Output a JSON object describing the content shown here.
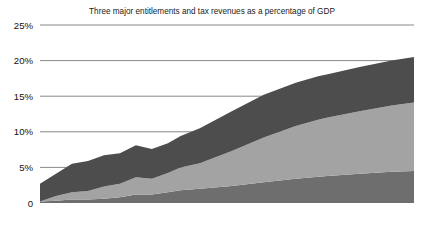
{
  "chart_data": {
    "type": "area",
    "title": "Three major entitlements and tax revenues as a percentage of GDP",
    "xlabel": "",
    "ylabel": "",
    "xlim": [
      1965,
      2082
    ],
    "ylim": [
      0,
      25
    ],
    "grid": true,
    "legend_position": "inline-labels",
    "stacked": true,
    "ytick_labels": [
      "0",
      "5%",
      "10%",
      "15%",
      "20%",
      "25%"
    ],
    "ytick_values": [
      0,
      5,
      10,
      15,
      20,
      25
    ],
    "xtick_labels": [
      "1965",
      "1975",
      "1985",
      "1995",
      "2005",
      "2015",
      "2025",
      "2035",
      "2045",
      "2055",
      "2065",
      "2075",
      "2082"
    ],
    "xtick_values": [
      1965,
      1975,
      1985,
      1995,
      2005,
      2015,
      2025,
      2035,
      2045,
      2055,
      2065,
      2075,
      2082
    ],
    "x": [
      1965,
      1970,
      1975,
      1980,
      1985,
      1990,
      1995,
      2000,
      2005,
      2009,
      2015,
      2025,
      2035,
      2045,
      2052,
      2055,
      2065,
      2075,
      2082
    ],
    "series": [
      {
        "name": "Medicaid",
        "color": "#6e6e6e",
        "values": [
          0.2,
          0.3,
          0.5,
          0.5,
          0.6,
          0.8,
          1.2,
          1.2,
          1.5,
          1.8,
          2.0,
          2.4,
          2.9,
          3.4,
          3.7,
          3.8,
          4.1,
          4.4,
          4.5
        ]
      },
      {
        "name": "Medicare",
        "color": "#a3a3a3",
        "values": [
          0.0,
          0.7,
          1.0,
          1.2,
          1.7,
          1.9,
          2.4,
          2.2,
          2.7,
          3.2,
          3.6,
          4.9,
          6.3,
          7.4,
          8.0,
          8.2,
          8.8,
          9.3,
          9.6
        ]
      },
      {
        "name": "Social Security",
        "color": "#4d4d4d",
        "values": [
          2.5,
          3.1,
          4.0,
          4.2,
          4.4,
          4.3,
          4.5,
          4.2,
          4.2,
          4.4,
          4.9,
          5.6,
          6.0,
          6.1,
          6.1,
          6.1,
          6.2,
          6.3,
          6.4
        ]
      }
    ],
    "tax_revenue_line": {
      "name": "Actual tax revenue",
      "color": "#000000",
      "x": [
        1965,
        1967,
        1969,
        1971,
        1973,
        1975,
        1977,
        1979,
        1981,
        1983,
        1985,
        1987,
        1989,
        1991,
        1993,
        1995,
        1997,
        1999,
        2000,
        2001,
        2003,
        2004,
        2006,
        2008,
        2009
      ],
      "values": [
        17.0,
        18.3,
        19.7,
        17.3,
        17.6,
        17.9,
        18.0,
        18.5,
        19.6,
        17.4,
        17.7,
        18.4,
        18.3,
        17.8,
        17.5,
        18.4,
        19.2,
        19.8,
        20.6,
        19.5,
        16.2,
        16.3,
        18.2,
        17.7,
        18.4
      ]
    },
    "average_line": {
      "label": "30-year average tax revenue (18.4%)",
      "value": 18.4,
      "from_x": 2009,
      "to_x": 2082,
      "color": "#000000"
    },
    "divider": {
      "x": 2009,
      "style": "dotted",
      "color": "#000000"
    },
    "annotations": [
      {
        "name": "actual-tax-revenue-label",
        "text": "Actual tax revenue",
        "x": 1987,
        "y": 22.1
      },
      {
        "name": "average-tax-revenue-label",
        "line1": "30-year average tax",
        "line2": "revenue (18.4%)",
        "x": 2013,
        "y": 16.8
      }
    ],
    "callout": {
      "text": "2052:Entitlements 18.5% of GDP",
      "box_color": "#000000",
      "text_color": "#ffffff",
      "marker_x": 2052,
      "marker_y": 18.5
    },
    "series_labels": [
      {
        "name": "Social Security",
        "line1": "Social",
        "line2": "Security",
        "x": 2041,
        "y": 13.6
      },
      {
        "name": "Medicare",
        "x": 2038,
        "y": 8.0
      },
      {
        "name": "Medicaid",
        "x": 2040,
        "y": 2.2
      }
    ]
  },
  "colors": {
    "background": "#ffffff",
    "grid": "#555555",
    "axis": "#111111",
    "social_security": "#4d4d4d",
    "medicare": "#a3a3a3",
    "medicaid": "#6e6e6e",
    "line": "#000000"
  }
}
